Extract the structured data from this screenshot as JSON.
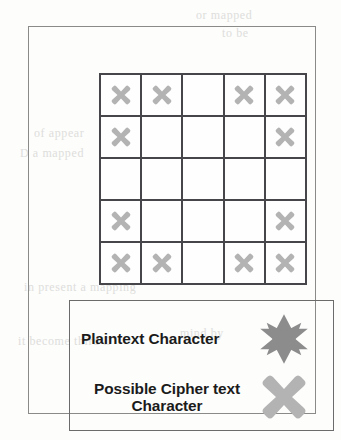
{
  "figure": {
    "colors": {
      "frame_border": "#8a8a88",
      "grid_line": "#46464a",
      "legend_border": "#6b6b6b",
      "plaintext_symbol": "#8c8c8c",
      "ciphertext_symbol": "#b3b3b3",
      "text": "#1b1b1b",
      "page_background": "#fdfdfc"
    }
  },
  "grid": {
    "rows": 5,
    "columns": 5,
    "mark_icon": "cross-mark",
    "cells": [
      [
        1,
        1,
        0,
        1,
        1
      ],
      [
        1,
        0,
        0,
        0,
        1
      ],
      [
        0,
        0,
        0,
        0,
        0
      ],
      [
        1,
        0,
        0,
        0,
        1
      ],
      [
        1,
        1,
        0,
        1,
        1
      ]
    ]
  },
  "legend": {
    "items": [
      {
        "label": "Plaintext Character",
        "symbol": "six-pointed-star",
        "color": "#8c8c8c"
      },
      {
        "label": "Possible Cipher text Character",
        "label_line1": "Possible Cipher text",
        "label_line2": "Character",
        "symbol": "cross-mark",
        "color": "#b3b3b3"
      }
    ]
  },
  "background_bleed": [
    {
      "text": "or mapped",
      "x": 196,
      "y": 8
    },
    {
      "text": "to be",
      "x": 222,
      "y": 26
    },
    {
      "text": "ciphertext",
      "x": 190,
      "y": 108
    },
    {
      "text": "of appear",
      "x": 34,
      "y": 126
    },
    {
      "text": "D a mapped",
      "x": 20,
      "y": 146
    },
    {
      "text": "then",
      "x": 212,
      "y": 200
    },
    {
      "text": "in present a mapping",
      "x": 24,
      "y": 280
    },
    {
      "text": "mind by",
      "x": 180,
      "y": 326
    },
    {
      "text": "it become third D",
      "x": 18,
      "y": 334
    }
  ]
}
